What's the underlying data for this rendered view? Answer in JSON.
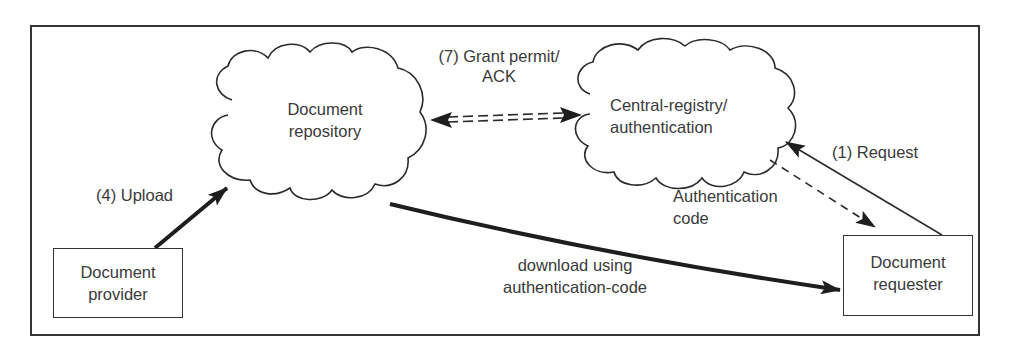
{
  "diagram": {
    "nodes": {
      "document_repository": {
        "label_line1": "Document",
        "label_line2": "repository",
        "shape": "cloud"
      },
      "central_registry": {
        "label_line1": "Central-registry/",
        "label_line2": "authentication",
        "shape": "cloud"
      },
      "document_provider": {
        "label_line1": "Document",
        "label_line2": "provider",
        "shape": "box"
      },
      "document_requester": {
        "label_line1": "Document",
        "label_line2": "requester",
        "shape": "box"
      }
    },
    "edges": {
      "grant_permit": {
        "label_line1": "(7) Grant permit/",
        "label_line2": "ACK",
        "style": "double-dashed bidirectional",
        "from": "Document repository",
        "to": "Central-registry/authentication"
      },
      "request": {
        "label": "(1) Request",
        "style": "solid",
        "from": "Document requester",
        "to": "Central-registry/authentication"
      },
      "auth_code": {
        "label_line1": "Authentication",
        "label_line2": "code",
        "style": "dashed",
        "from": "Central-registry/authentication",
        "to": "Document requester"
      },
      "upload": {
        "label": "(4) Upload",
        "style": "thick solid",
        "from": "Document provider",
        "to": "Document repository"
      },
      "download": {
        "label_line1": "download using",
        "label_line2": "authentication-code",
        "style": "thick solid",
        "from": "Document repository",
        "to": "Document requester"
      }
    },
    "colors": {
      "stroke": "#2b2b2b",
      "text": "#3a3a3a",
      "background": "#ffffff"
    }
  }
}
